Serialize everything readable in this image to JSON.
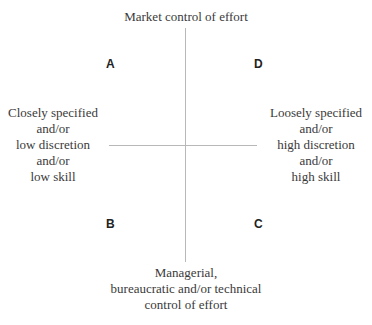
{
  "diagram": {
    "axes": {
      "vertical": {
        "top": "Market control of effort",
        "bottom": "Managerial,\nbureaucratic and/or technical\ncontrol of effort"
      },
      "horizontal": {
        "left": "Closely specified\nand/or\nlow discretion\nand/or\nlow skill",
        "right": "Loosely specified\nand/or\nhigh discretion\nand/or\nhigh skill"
      }
    },
    "quadrants": {
      "top_left": "A",
      "top_right": "D",
      "bottom_left": "B",
      "bottom_right": "C"
    },
    "colors": {
      "axis_line": "#b8b8b8",
      "text": "#3a3a3a"
    }
  }
}
